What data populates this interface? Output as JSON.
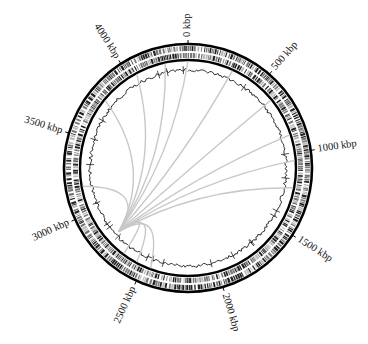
{
  "diagram": {
    "type": "circular-genome-map",
    "genome_length_kbp": 4400,
    "center": [
      188,
      168
    ],
    "colors": {
      "ring": "#000000",
      "feature_dark": "#222222",
      "feature_mid": "#777777",
      "feature_light": "#bbbbbb",
      "gc_trace": "#1a1a1a",
      "link": "#c8c8c8",
      "label": "#111111"
    },
    "rings": {
      "outer_black_radius": 124,
      "inner_black_radius": 108,
      "forward_features": {
        "r_inner": 117,
        "r_outer": 122
      },
      "reverse_features": {
        "r_inner": 110,
        "r_outer": 115
      },
      "gc_trace_radius": 98
    },
    "tick_labels": [
      {
        "label": "0 kbp",
        "kbp": 0
      },
      {
        "label": "500 kbp",
        "kbp": 500
      },
      {
        "label": "1000 kbp",
        "kbp": 1000
      },
      {
        "label": "1500 kbp",
        "kbp": 1500
      },
      {
        "label": "2000 kbp",
        "kbp": 2000
      },
      {
        "label": "2500 kbp",
        "kbp": 2500
      },
      {
        "label": "3000 kbp",
        "kbp": 3000
      },
      {
        "label": "3500 kbp",
        "kbp": 3500
      },
      {
        "label": "4000 kbp",
        "kbp": 4000
      }
    ],
    "links": {
      "hub_kbp": 2780,
      "targets_kbp": [
        0,
        300,
        620,
        880,
        1050,
        1230,
        2450,
        2550,
        2650,
        3180,
        3780,
        4050,
        4250
      ]
    }
  }
}
